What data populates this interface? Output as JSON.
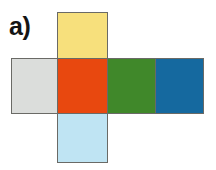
{
  "figure": {
    "label": "a)",
    "caption_letter": "a",
    "type": "cube-net-diagram",
    "background_color": "#FFFFFF",
    "outline_color": "#6A6A66"
  },
  "cube_net": {
    "arrangement": "cross",
    "face_count": 6,
    "faces": [
      {
        "id": "top",
        "position": "top",
        "grid_column": 2,
        "grid_row": 1,
        "color": "#F7E07C",
        "color_name": "yellow"
      },
      {
        "id": "left",
        "position": "left",
        "grid_column": 1,
        "grid_row": 2,
        "color": "#DBDDDB",
        "color_name": "light gray"
      },
      {
        "id": "front",
        "position": "center",
        "grid_column": 2,
        "grid_row": 2,
        "color": "#E8480F",
        "color_name": "orange red"
      },
      {
        "id": "right",
        "position": "right",
        "grid_column": 3,
        "grid_row": 2,
        "color": "#40882A",
        "color_name": "green"
      },
      {
        "id": "back",
        "position": "far-right",
        "grid_column": 4,
        "grid_row": 2,
        "color": "#15699F",
        "color_name": "blue"
      },
      {
        "id": "bottom",
        "position": "bottom",
        "grid_column": 2,
        "grid_row": 3,
        "color": "#BFE4F3",
        "color_name": "light blue"
      }
    ]
  }
}
